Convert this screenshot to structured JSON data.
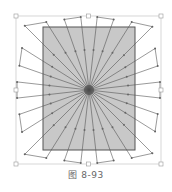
{
  "figure": {
    "caption": "图 8-93",
    "center": [
      89,
      90
    ],
    "bounding_box": {
      "x": 16,
      "y": 16,
      "w": 145,
      "h": 148
    },
    "rectangle": {
      "x": 43,
      "y": 27,
      "w": 92,
      "h": 123,
      "fill": "#c8c8c8",
      "stroke": "#555555"
    },
    "ray_count": 28,
    "colors": {
      "ray": "#555555",
      "handle": "#999999",
      "node": "#666666"
    }
  }
}
